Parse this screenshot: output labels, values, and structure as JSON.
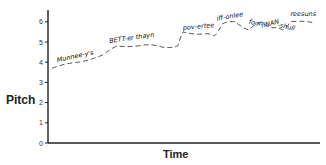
{
  "chart_data": {
    "type": "line",
    "title": "",
    "xlabel": "Time",
    "ylabel": "Pitch",
    "ylim": [
      0,
      6.5
    ],
    "yticks": [
      0,
      1,
      2,
      3,
      4,
      5,
      6
    ],
    "grid": false,
    "legend": null,
    "line_style": "dashed",
    "series": [
      {
        "name": "pitch contour",
        "points": [
          {
            "x": 0.0,
            "y": 3.7
          },
          {
            "x": 0.1,
            "y": 4.0
          },
          {
            "x": 0.2,
            "y": 4.4
          },
          {
            "x": 0.25,
            "y": 4.8
          },
          {
            "x": 0.35,
            "y": 4.85
          },
          {
            "x": 0.42,
            "y": 4.75
          },
          {
            "x": 0.48,
            "y": 4.8
          },
          {
            "x": 0.5,
            "y": 5.5
          },
          {
            "x": 0.58,
            "y": 5.4
          },
          {
            "x": 0.62,
            "y": 5.3
          },
          {
            "x": 0.65,
            "y": 5.9
          },
          {
            "x": 0.7,
            "y": 6.0
          },
          {
            "x": 0.75,
            "y": 5.6
          },
          {
            "x": 0.8,
            "y": 6.0
          },
          {
            "x": 0.84,
            "y": 5.7
          },
          {
            "x": 0.88,
            "y": 5.6
          },
          {
            "x": 0.91,
            "y": 6.0
          },
          {
            "x": 1.0,
            "y": 5.95
          }
        ]
      }
    ],
    "annotations": [
      {
        "text": "Munnee-y's",
        "x": 0.02,
        "y": 4.0
      },
      {
        "text": "BETT-er thayn",
        "x": 0.22,
        "y": 4.95
      },
      {
        "text": "pov-ertee",
        "x": 0.5,
        "y": 5.6
      },
      {
        "text": "iff-onlee",
        "x": 0.63,
        "y": 6.05
      },
      {
        "text": "foor",
        "x": 0.75,
        "y": 5.9
      },
      {
        "text": "fiNAN",
        "x": 0.8,
        "y": 5.7
      },
      {
        "text": "-shull",
        "x": 0.86,
        "y": 5.75
      },
      {
        "text": "reesuns",
        "x": 0.91,
        "y": 6.3
      }
    ]
  },
  "axes": {
    "y_label": "Pitch",
    "x_label": "Time",
    "y_ticks": [
      "0",
      "1",
      "2",
      "3",
      "4",
      "5",
      "6"
    ]
  }
}
